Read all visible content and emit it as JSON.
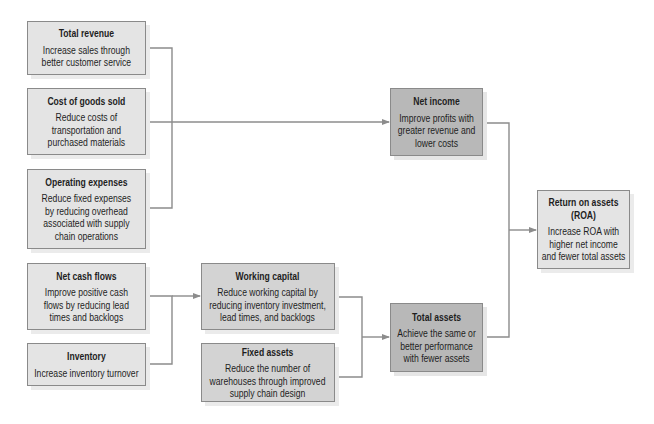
{
  "diagram": {
    "colors": {
      "light": "#e4e4e4",
      "medium": "#d3d3d3",
      "dark": "#b8b8b8",
      "border": "#8a8a8a",
      "connector": "#8c8c8c"
    },
    "boxes": [
      {
        "id": "total_revenue",
        "title": "Total revenue",
        "lines": [
          "Increase sales through",
          "better customer service"
        ]
      },
      {
        "id": "cost_of_goods_sold",
        "title": "Cost of goods sold",
        "lines": [
          "Reduce costs of",
          "transportation and",
          "purchased materials"
        ]
      },
      {
        "id": "operating_expenses",
        "title": "Operating expenses",
        "lines": [
          "Reduce fixed expenses",
          "by reducing overhead",
          "associated with supply",
          "chain operations"
        ]
      },
      {
        "id": "net_cash_flows",
        "title": "Net cash flows",
        "lines": [
          "Improve positive cash",
          "flows by reducing lead",
          "times and backlogs"
        ]
      },
      {
        "id": "inventory",
        "title": "Inventory",
        "lines": [
          "Increase inventory turnover"
        ]
      },
      {
        "id": "working_capital",
        "title": "Working capital",
        "lines": [
          "Reduce working capital by",
          "reducing inventory investment,",
          "lead times, and backlogs"
        ]
      },
      {
        "id": "fixed_assets",
        "title": "Fixed assets",
        "lines": [
          "Reduce the number of",
          "warehouses through improved",
          "supply chain design"
        ]
      },
      {
        "id": "net_income",
        "title": "Net income",
        "lines": [
          "Improve profits with",
          "greater revenue and",
          "lower costs"
        ]
      },
      {
        "id": "total_assets",
        "title": "Total assets",
        "lines": [
          "Achieve the same or",
          "better performance",
          "with fewer assets"
        ]
      },
      {
        "id": "return_on_assets",
        "title_lines": [
          "Return on assets",
          "(ROA)"
        ],
        "lines": [
          "Increase ROA with",
          "higher net income",
          "and fewer total assets"
        ]
      }
    ],
    "connections": [
      {
        "from": [
          "total_revenue",
          "cost_of_goods_sold",
          "operating_expenses"
        ],
        "to": "net_income"
      },
      {
        "from": [
          "net_cash_flows",
          "inventory"
        ],
        "to": "working_capital"
      },
      {
        "from": [
          "working_capital",
          "fixed_assets"
        ],
        "to": "total_assets"
      },
      {
        "from": [
          "net_income",
          "total_assets"
        ],
        "to": "return_on_assets"
      }
    ]
  }
}
